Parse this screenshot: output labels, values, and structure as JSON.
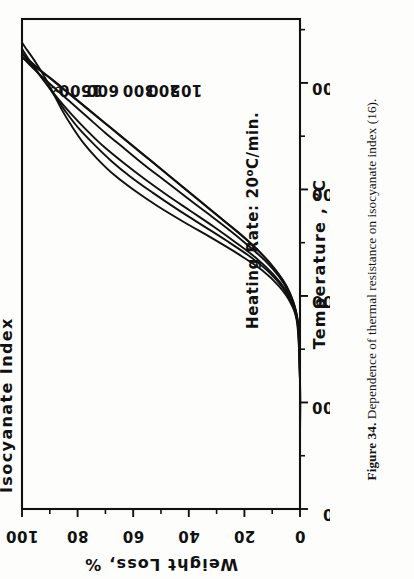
{
  "caption": {
    "figure_number": "Figure 34.",
    "text": "Dependence of thermal resistance on isocyanate index (16)."
  },
  "figure": {
    "legend_title": "Isocyanate Index",
    "note": "Heating Rate:  20",
    "note_sup": "o",
    "note_tail": "C/min.",
    "note_full": "Heating Rate:  20°C/min."
  },
  "chart_data": {
    "type": "line",
    "title": "Isocyanate Index",
    "xlabel": "Temperature ,  °C",
    "ylabel": "Weight Loss, %",
    "xlim": [
      0,
      460
    ],
    "ylim": [
      0,
      100
    ],
    "y_inverted": true,
    "grid": false,
    "legend_position": "inline-labels-top",
    "annotation": "Heating Rate:  20°C/min.",
    "xticks": [
      0,
      100,
      200,
      300,
      400
    ],
    "xticks_minor": [
      50,
      150,
      250,
      350,
      450
    ],
    "yticks": [
      0,
      20,
      40,
      60,
      80,
      100
    ],
    "yticks_minor": [
      10,
      30,
      50,
      70,
      90
    ],
    "xtick_labels": [
      "0",
      "100",
      "200",
      "300",
      "400"
    ],
    "ytick_labels": [
      "0",
      "20",
      "40",
      "60",
      "80",
      "100"
    ],
    "series": [
      {
        "name": "∞",
        "label": "∞",
        "points": [
          [
            0,
            0
          ],
          [
            60,
            0
          ],
          [
            120,
            0
          ],
          [
            160,
            0.3
          ],
          [
            180,
            1.0
          ],
          [
            195,
            2.5
          ],
          [
            210,
            5.0
          ],
          [
            225,
            9.0
          ],
          [
            240,
            14.0
          ],
          [
            255,
            20.0
          ],
          [
            270,
            27.0
          ],
          [
            285,
            34.0
          ],
          [
            300,
            41.0
          ],
          [
            315,
            48.0
          ],
          [
            330,
            55.0
          ],
          [
            345,
            62.0
          ],
          [
            360,
            69.0
          ],
          [
            375,
            76.0
          ],
          [
            390,
            83.0
          ],
          [
            405,
            90.0
          ],
          [
            418,
            97.0
          ],
          [
            424,
            100
          ]
        ]
      },
      {
        "name": "1500",
        "label": "1500",
        "points": [
          [
            0,
            0
          ],
          [
            60,
            0
          ],
          [
            120,
            0
          ],
          [
            165,
            0.4
          ],
          [
            185,
            1.4
          ],
          [
            200,
            3.2
          ],
          [
            215,
            6.2
          ],
          [
            230,
            10.5
          ],
          [
            245,
            16.0
          ],
          [
            260,
            22.5
          ],
          [
            275,
            29.5
          ],
          [
            290,
            36.5
          ],
          [
            305,
            43.5
          ],
          [
            320,
            50.5
          ],
          [
            335,
            57.5
          ],
          [
            350,
            64.5
          ],
          [
            365,
            71.5
          ],
          [
            380,
            78.5
          ],
          [
            395,
            85.5
          ],
          [
            410,
            92.5
          ],
          [
            425,
            99.0
          ],
          [
            430,
            100
          ]
        ]
      },
      {
        "name": "600",
        "label": "600",
        "points": [
          [
            0,
            0
          ],
          [
            60,
            0
          ],
          [
            120,
            0
          ],
          [
            168,
            0.5
          ],
          [
            188,
            1.8
          ],
          [
            203,
            4.0
          ],
          [
            218,
            7.5
          ],
          [
            233,
            12.5
          ],
          [
            248,
            19.0
          ],
          [
            263,
            26.0
          ],
          [
            278,
            33.5
          ],
          [
            293,
            41.0
          ],
          [
            308,
            48.5
          ],
          [
            323,
            56.0
          ],
          [
            338,
            63.0
          ],
          [
            353,
            70.0
          ],
          [
            368,
            76.5
          ],
          [
            383,
            83.0
          ],
          [
            398,
            89.5
          ],
          [
            415,
            96.5
          ],
          [
            425,
            100
          ]
        ]
      },
      {
        "name": "300",
        "label": "300",
        "points": [
          [
            0,
            0
          ],
          [
            60,
            0
          ],
          [
            120,
            0
          ],
          [
            170,
            0.6
          ],
          [
            190,
            2.2
          ],
          [
            205,
            5.0
          ],
          [
            220,
            9.5
          ],
          [
            235,
            15.5
          ],
          [
            250,
            23.0
          ],
          [
            265,
            31.0
          ],
          [
            280,
            39.5
          ],
          [
            295,
            48.0
          ],
          [
            310,
            56.0
          ],
          [
            325,
            63.5
          ],
          [
            340,
            70.5
          ],
          [
            355,
            76.5
          ],
          [
            370,
            82.0
          ],
          [
            385,
            87.0
          ],
          [
            400,
            91.5
          ],
          [
            415,
            96.0
          ],
          [
            428,
            100
          ]
        ]
      },
      {
        "name": "200",
        "label": "200",
        "points": [
          [
            0,
            0
          ],
          [
            60,
            0
          ],
          [
            120,
            0
          ],
          [
            172,
            0.8
          ],
          [
            192,
            2.8
          ],
          [
            207,
            6.0
          ],
          [
            222,
            11.0
          ],
          [
            237,
            18.0
          ],
          [
            252,
            26.5
          ],
          [
            267,
            35.5
          ],
          [
            282,
            44.5
          ],
          [
            297,
            53.0
          ],
          [
            312,
            61.0
          ],
          [
            327,
            68.0
          ],
          [
            342,
            74.0
          ],
          [
            357,
            79.5
          ],
          [
            372,
            84.0
          ],
          [
            387,
            88.0
          ],
          [
            402,
            92.0
          ],
          [
            418,
            96.5
          ],
          [
            432,
            100
          ]
        ]
      },
      {
        "name": "105",
        "label": "105",
        "points": [
          [
            0,
            0
          ],
          [
            60,
            0
          ],
          [
            120,
            0
          ],
          [
            174,
            1.0
          ],
          [
            194,
            3.5
          ],
          [
            209,
            7.5
          ],
          [
            224,
            13.5
          ],
          [
            239,
            22.0
          ],
          [
            254,
            31.5
          ],
          [
            269,
            41.5
          ],
          [
            284,
            51.0
          ],
          [
            299,
            59.5
          ],
          [
            314,
            67.0
          ],
          [
            329,
            73.0
          ],
          [
            344,
            78.0
          ],
          [
            359,
            82.0
          ],
          [
            374,
            85.5
          ],
          [
            389,
            88.5
          ],
          [
            404,
            91.5
          ],
          [
            419,
            95.0
          ],
          [
            434,
            99.0
          ],
          [
            438,
            100
          ]
        ]
      }
    ],
    "series_label_positions": [
      {
        "name": "∞",
        "x": 398,
        "y": 88
      },
      {
        "name": "1500",
        "x": 398,
        "y": 79
      },
      {
        "name": "600",
        "x": 398,
        "y": 71
      },
      {
        "name": "300",
        "x": 398,
        "y": 58
      },
      {
        "name": "200",
        "x": 398,
        "y": 49
      },
      {
        "name": "105",
        "x": 398,
        "y": 41
      }
    ]
  }
}
